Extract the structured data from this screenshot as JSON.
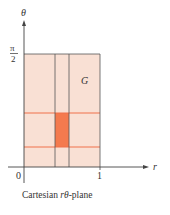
{
  "diagram": {
    "caption_prefix": "Cartesian ",
    "caption_var": "rθ",
    "caption_suffix": "-plane",
    "axes": {
      "x_label": "r",
      "y_label": "θ",
      "origin_label": "0",
      "x_tick_label": "1",
      "y_tick_numerator": "π",
      "y_tick_denominator": "2"
    },
    "region_label": "G",
    "colors": {
      "region_fill": "#f9e0d4",
      "grid_line_vertical": "#555555",
      "grid_line_horizontal": "#f0714a",
      "highlighted_cell": "#f47a4e",
      "axis": "#444444"
    },
    "region": {
      "r_min": 0,
      "r_max": 1,
      "theta_min": 0,
      "theta_max": "π/2"
    },
    "grid": {
      "vertical_lines_r": [
        0.42,
        0.6
      ],
      "horizontal_lines_fraction": [
        0.49,
        0.14
      ]
    }
  }
}
